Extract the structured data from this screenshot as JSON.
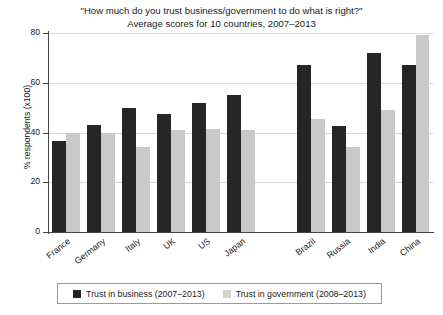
{
  "chart_data": {
    "type": "bar",
    "title": "\"How much do you trust business/government to do what is right?\"",
    "subtitle": "Average scores for 10 countries, 2007–2013",
    "xlabel": "",
    "ylabel": "% respondents (x100)",
    "ylim": [
      0,
      80
    ],
    "yticks": [
      0,
      20,
      40,
      60,
      80
    ],
    "ytick_labels": [
      "0",
      "20",
      "40",
      "60",
      "80"
    ],
    "grid": true,
    "legend_position": "bottom",
    "categories": [
      "France",
      "Germany",
      "Italy",
      "UK",
      "US",
      "Japan",
      "Brazil",
      "Russia",
      "India",
      "China"
    ],
    "series": [
      {
        "name": "Trust in business (2007–2013)",
        "color": "#262626",
        "values": [
          36.5,
          43,
          50,
          47.5,
          52,
          55,
          67,
          42.5,
          72,
          67
        ]
      },
      {
        "name": "Trust in government (2008–2013)",
        "color": "#c9c9c9",
        "values": [
          40,
          40,
          34,
          41,
          41.5,
          41,
          45.5,
          34,
          49,
          79
        ]
      }
    ]
  },
  "legend": {
    "entries": [
      {
        "label": "Trust in business (2007–2013)",
        "swatch": "business"
      },
      {
        "label": "Trust in government (2008–2013)",
        "swatch": "government"
      }
    ]
  }
}
